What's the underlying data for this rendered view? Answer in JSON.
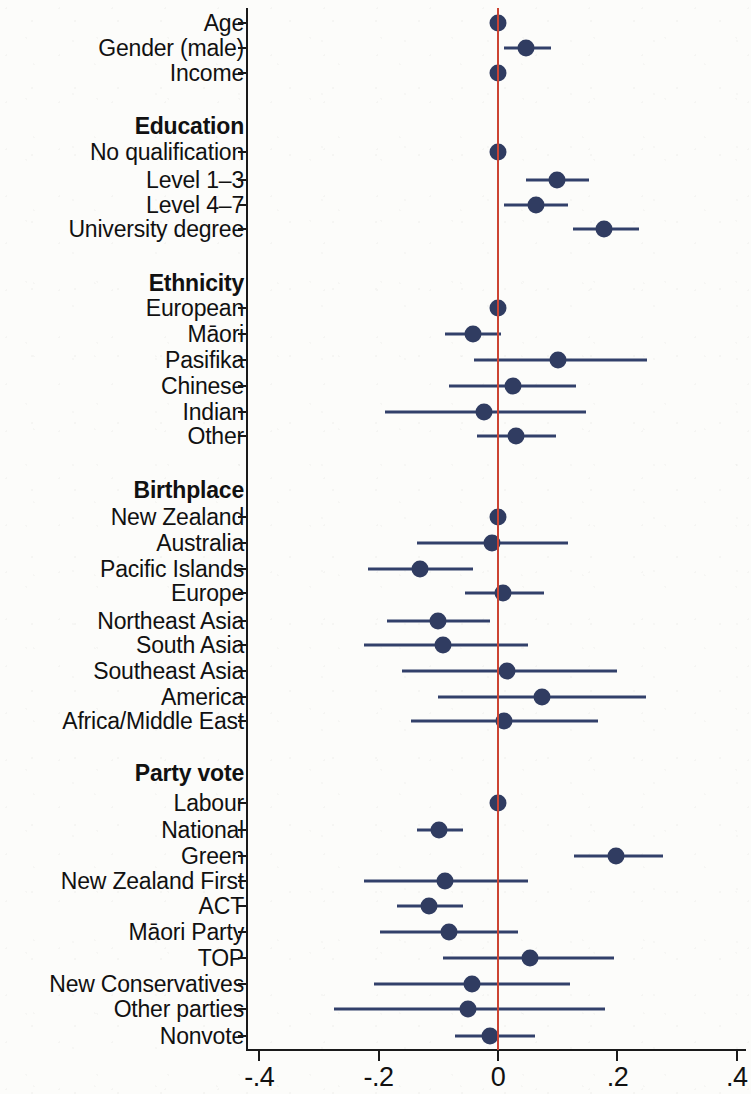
{
  "figure": {
    "type": "coefficient-forest-plot",
    "point_color": "#303c61",
    "line_color": "#32406a",
    "zero_line_color": "#cc4433",
    "background_color": "#fcfcfa"
  },
  "chart_data": {
    "type": "scatter",
    "title": "",
    "subtitle": "",
    "xlabel": "",
    "ylabel": "",
    "xlim": [
      -0.4,
      0.4
    ],
    "xticks": [
      -0.4,
      -0.2,
      0,
      0.2,
      0.4
    ],
    "xticklabels": [
      "-.4",
      "-.2",
      "0",
      ".2",
      ".4"
    ],
    "grid": false,
    "legend": null,
    "reference_line_x": 0,
    "orientation": "horizontal-intervals",
    "rows": [
      {
        "label": "Age",
        "type": "estimate",
        "estimate": 0.0,
        "ci_low": -0.004,
        "ci_high": 0.004
      },
      {
        "label": "Gender (male)",
        "type": "estimate",
        "estimate": 0.047,
        "ci_low": 0.01,
        "ci_high": 0.088
      },
      {
        "label": "Income",
        "type": "estimate",
        "estimate": 0.0,
        "ci_low": -0.004,
        "ci_high": 0.004
      },
      {
        "label": "Education",
        "type": "header"
      },
      {
        "label": "No qualification",
        "type": "estimate",
        "estimate": 0.0,
        "ci_low": 0.0,
        "ci_high": 0.0,
        "reference": true
      },
      {
        "label": "Level 1–3",
        "type": "estimate",
        "estimate": 0.099,
        "ci_low": 0.047,
        "ci_high": 0.153
      },
      {
        "label": "Level 4–7",
        "type": "estimate",
        "estimate": 0.064,
        "ci_low": 0.01,
        "ci_high": 0.118
      },
      {
        "label": "University degree",
        "type": "estimate",
        "estimate": 0.177,
        "ci_low": 0.125,
        "ci_high": 0.236
      },
      {
        "label": "Ethnicity",
        "type": "header"
      },
      {
        "label": "European",
        "type": "estimate",
        "estimate": 0.0,
        "ci_low": 0.0,
        "ci_high": 0.0,
        "reference": true
      },
      {
        "label": "Māori",
        "type": "estimate",
        "estimate": -0.042,
        "ci_low": -0.088,
        "ci_high": 0.005
      },
      {
        "label": "Pasifika",
        "type": "estimate",
        "estimate": 0.1,
        "ci_low": -0.04,
        "ci_high": 0.25
      },
      {
        "label": "Chinese",
        "type": "estimate",
        "estimate": 0.025,
        "ci_low": -0.082,
        "ci_high": 0.131
      },
      {
        "label": "Indian",
        "type": "estimate",
        "estimate": -0.023,
        "ci_low": -0.19,
        "ci_high": 0.148
      },
      {
        "label": "Other",
        "type": "estimate",
        "estimate": 0.03,
        "ci_low": -0.035,
        "ci_high": 0.097
      },
      {
        "label": "Birthplace",
        "type": "header"
      },
      {
        "label": "New Zealand",
        "type": "estimate",
        "estimate": 0.0,
        "ci_low": 0.0,
        "ci_high": 0.0,
        "reference": true
      },
      {
        "label": "Australia",
        "type": "estimate",
        "estimate": -0.01,
        "ci_low": -0.135,
        "ci_high": 0.118
      },
      {
        "label": "Pacific Islands",
        "type": "estimate",
        "estimate": -0.131,
        "ci_low": -0.218,
        "ci_high": -0.042
      },
      {
        "label": "Europe",
        "type": "estimate",
        "estimate": 0.008,
        "ci_low": -0.055,
        "ci_high": 0.077
      },
      {
        "label": "Northeast Asia",
        "type": "estimate",
        "estimate": -0.1,
        "ci_low": -0.186,
        "ci_high": -0.013
      },
      {
        "label": "South Asia",
        "type": "estimate",
        "estimate": -0.092,
        "ci_low": -0.225,
        "ci_high": 0.05
      },
      {
        "label": "Southeast Asia",
        "type": "estimate",
        "estimate": 0.015,
        "ci_low": -0.16,
        "ci_high": 0.2
      },
      {
        "label": "America",
        "type": "estimate",
        "estimate": 0.073,
        "ci_low": -0.1,
        "ci_high": 0.248
      },
      {
        "label": "Africa/Middle East",
        "type": "estimate",
        "estimate": 0.01,
        "ci_low": -0.145,
        "ci_high": 0.168
      },
      {
        "label": "Party vote",
        "type": "header"
      },
      {
        "label": "Labour",
        "type": "estimate",
        "estimate": 0.0,
        "ci_low": 0.0,
        "ci_high": 0.0,
        "reference": true
      },
      {
        "label": "National",
        "type": "estimate",
        "estimate": -0.098,
        "ci_low": -0.136,
        "ci_high": -0.058
      },
      {
        "label": "Green",
        "type": "estimate",
        "estimate": 0.198,
        "ci_low": 0.128,
        "ci_high": 0.276
      },
      {
        "label": "New Zealand First",
        "type": "estimate",
        "estimate": -0.088,
        "ci_low": -0.224,
        "ci_high": 0.05
      },
      {
        "label": "ACT",
        "type": "estimate",
        "estimate": -0.115,
        "ci_low": -0.17,
        "ci_high": -0.058
      },
      {
        "label": "Māori Party",
        "type": "estimate",
        "estimate": -0.082,
        "ci_low": -0.198,
        "ci_high": 0.033
      },
      {
        "label": "TOP",
        "type": "estimate",
        "estimate": 0.053,
        "ci_low": -0.092,
        "ci_high": 0.195
      },
      {
        "label": "New Conservatives",
        "type": "estimate",
        "estimate": -0.043,
        "ci_low": -0.208,
        "ci_high": 0.12
      },
      {
        "label": "Other parties",
        "type": "estimate",
        "estimate": -0.05,
        "ci_low": -0.275,
        "ci_high": 0.18
      },
      {
        "label": "Nonvote",
        "type": "estimate",
        "estimate": -0.013,
        "ci_low": -0.072,
        "ci_high": 0.062
      }
    ]
  },
  "layout": {
    "row_y": [
      23,
      48,
      73,
      126,
      152,
      180,
      205,
      229,
      283,
      308,
      334,
      360,
      386,
      412,
      436,
      490,
      517,
      543,
      569,
      593,
      621,
      645,
      671,
      697,
      721,
      773,
      803,
      830,
      856,
      881,
      906,
      932,
      958,
      984,
      1009,
      1036
    ],
    "x_zero_px": 498,
    "px_per_unit": 597
  }
}
